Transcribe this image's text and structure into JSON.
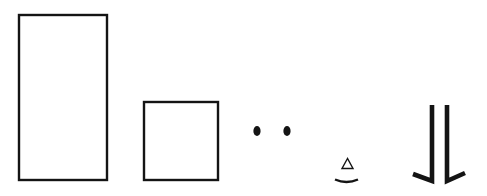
{
  "diagram": {
    "stroke_color": "#141414",
    "background": "#ffffff",
    "shapes": [
      {
        "id": "tall-rectangle",
        "type": "rect",
        "x": 18,
        "y": 14,
        "w": 89,
        "h": 166
      },
      {
        "id": "square",
        "type": "rect",
        "x": 143,
        "y": 101,
        "w": 75,
        "h": 79
      },
      {
        "id": "dot-left",
        "type": "dot",
        "cx": 257,
        "cy": 131
      },
      {
        "id": "dot-right",
        "type": "dot",
        "cx": 287,
        "cy": 131
      },
      {
        "id": "triangle",
        "type": "triangle"
      },
      {
        "id": "arc",
        "type": "arc"
      },
      {
        "id": "leg-left",
        "type": "leg"
      },
      {
        "id": "leg-right",
        "type": "leg"
      }
    ]
  }
}
